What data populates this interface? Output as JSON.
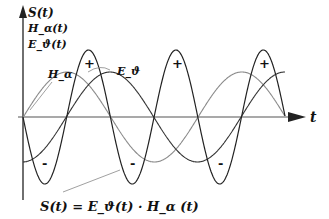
{
  "diagram": {
    "axes": {
      "y_labels": [
        "S(t)",
        "H_α(t)",
        "E_ϑ(t)"
      ],
      "x_label": "t"
    },
    "curve_labels": {
      "h": "H_α",
      "e": "E_ϑ"
    },
    "signs": {
      "plus": "+",
      "minus": "-"
    },
    "formula": "S(t) = E_ϑ(t) · H_α (t)",
    "colors": {
      "s_curve": "#222222",
      "e_curve": "#333333",
      "h_curve": "#8a8a8a",
      "axis": "#333333"
    }
  }
}
